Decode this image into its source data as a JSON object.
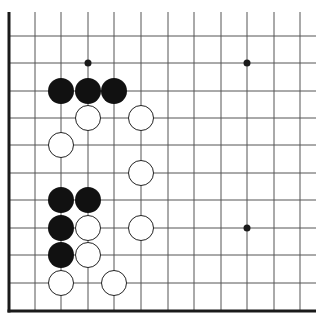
{
  "board": {
    "type": "go-diagram-corner",
    "colors": {
      "background": "#ffffff",
      "line": "#555555",
      "edge": "#1a1a1a",
      "black_stone": "#111111",
      "white_stone": "#ffffff",
      "white_stroke": "#222222"
    },
    "grid": {
      "columns_x": [
        9,
        35,
        61,
        88,
        114,
        141,
        168,
        194,
        221,
        247,
        274,
        300
      ],
      "rows_y": [
        36,
        63,
        91,
        118,
        145,
        173,
        200,
        228,
        255,
        283,
        310
      ],
      "line_top": 12,
      "line_right": 316,
      "left_edge_x": 9,
      "bottom_edge_y": 311
    },
    "star_points": [
      {
        "col": 3,
        "row": 1
      },
      {
        "col": 9,
        "row": 1
      },
      {
        "col": 9,
        "row": 7
      }
    ],
    "stones": [
      {
        "color": "black",
        "col": 2,
        "row": 2
      },
      {
        "color": "black",
        "col": 3,
        "row": 2
      },
      {
        "color": "black",
        "col": 4,
        "row": 2
      },
      {
        "color": "white",
        "col": 3,
        "row": 3
      },
      {
        "color": "white",
        "col": 5,
        "row": 3
      },
      {
        "color": "white",
        "col": 2,
        "row": 4
      },
      {
        "color": "white",
        "col": 5,
        "row": 5
      },
      {
        "color": "black",
        "col": 2,
        "row": 6
      },
      {
        "color": "black",
        "col": 3,
        "row": 6
      },
      {
        "color": "black",
        "col": 2,
        "row": 7
      },
      {
        "color": "white",
        "col": 3,
        "row": 7
      },
      {
        "color": "white",
        "col": 5,
        "row": 7
      },
      {
        "color": "black",
        "col": 2,
        "row": 8
      },
      {
        "color": "white",
        "col": 3,
        "row": 8
      },
      {
        "color": "white",
        "col": 2,
        "row": 9
      },
      {
        "color": "white",
        "col": 4,
        "row": 9
      }
    ],
    "stone_radius": 13
  }
}
